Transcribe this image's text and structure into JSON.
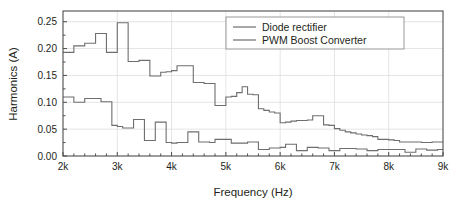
{
  "chart_data": {
    "type": "line",
    "subtype": "step",
    "title": "",
    "xlabel": "Frequency (Hz)",
    "ylabel": "Harmonics (A)",
    "xlim": [
      2000,
      9000
    ],
    "ylim": [
      0.0,
      0.27
    ],
    "xticks": [
      2000,
      3000,
      4000,
      5000,
      6000,
      7000,
      8000,
      9000
    ],
    "xtick_labels": [
      "2k",
      "3k",
      "4k",
      "5k",
      "6k",
      "7k",
      "8k",
      "9k"
    ],
    "yticks": [
      0.0,
      0.05,
      0.1,
      0.15,
      0.2,
      0.25
    ],
    "ytick_labels": [
      "0.00",
      "0.05",
      "0.10",
      "0.15",
      "0.20",
      "0.25"
    ],
    "x_minor_ticks_per_interval": 5,
    "y_minor_ticks_per_interval": 2,
    "grid": true,
    "grid_color": "#d9d9d9",
    "legend_position": "top-right",
    "x": [
      2000,
      2100,
      2200,
      2300,
      2400,
      2500,
      2600,
      2700,
      2800,
      2900,
      3000,
      3100,
      3200,
      3300,
      3400,
      3500,
      3600,
      3700,
      3800,
      3900,
      4000,
      4100,
      4200,
      4300,
      4400,
      4500,
      4600,
      4700,
      4800,
      4900,
      5000,
      5100,
      5200,
      5300,
      5400,
      5500,
      5600,
      5700,
      5800,
      5900,
      6000,
      6100,
      6200,
      6300,
      6400,
      6500,
      6600,
      6700,
      6800,
      6900,
      7000,
      7100,
      7200,
      7300,
      7400,
      7500,
      7600,
      7700,
      7800,
      7900,
      8000,
      8100,
      8200,
      8300,
      8400,
      8500,
      8600,
      8700,
      8800,
      8900,
      9000
    ],
    "series": [
      {
        "name": "Diode rectifier",
        "color": "#6e6e6e",
        "values": [
          0.193,
          0.193,
          0.205,
          0.205,
          0.21,
          0.21,
          0.228,
          0.228,
          0.193,
          0.193,
          0.248,
          0.248,
          0.176,
          0.176,
          0.178,
          0.178,
          0.149,
          0.149,
          0.156,
          0.157,
          0.159,
          0.168,
          0.168,
          0.168,
          0.137,
          0.137,
          0.135,
          0.135,
          0.094,
          0.094,
          0.11,
          0.111,
          0.118,
          0.129,
          0.115,
          0.114,
          0.088,
          0.085,
          0.082,
          0.08,
          0.062,
          0.063,
          0.065,
          0.066,
          0.066,
          0.067,
          0.075,
          0.075,
          0.058,
          0.057,
          0.051,
          0.048,
          0.045,
          0.043,
          0.041,
          0.039,
          0.038,
          0.036,
          0.031,
          0.031,
          0.03,
          0.029,
          0.026,
          0.026,
          0.026,
          0.026,
          0.025,
          0.025,
          0.026,
          0.026,
          0.026
        ]
      },
      {
        "name": "PWM Boost Converter",
        "color": "#6e6e6e",
        "values": [
          0.11,
          0.11,
          0.1,
          0.1,
          0.107,
          0.107,
          0.107,
          0.101,
          0.101,
          0.057,
          0.055,
          0.052,
          0.052,
          0.068,
          0.068,
          0.029,
          0.029,
          0.063,
          0.063,
          0.025,
          0.024,
          0.025,
          0.025,
          0.045,
          0.045,
          0.026,
          0.026,
          0.025,
          0.031,
          0.031,
          0.031,
          0.024,
          0.024,
          0.024,
          0.026,
          0.026,
          0.012,
          0.012,
          0.015,
          0.015,
          0.016,
          0.022,
          0.022,
          0.01,
          0.01,
          0.016,
          0.016,
          0.015,
          0.015,
          0.01,
          0.01,
          0.014,
          0.014,
          0.014,
          0.013,
          0.013,
          0.01,
          0.01,
          0.012,
          0.012,
          0.012,
          0.012,
          0.012,
          0.007,
          0.007,
          0.013,
          0.013,
          0.011,
          0.011,
          0.012,
          0.012
        ]
      }
    ]
  },
  "legend": {
    "items": [
      {
        "label": "Diode rectifier"
      },
      {
        "label": "PWM Boost Converter"
      }
    ]
  }
}
